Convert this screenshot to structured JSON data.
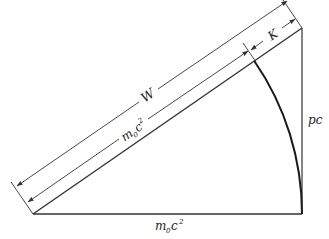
{
  "diagram": {
    "colors": {
      "line": "#333333",
      "arc": "#1a1a1a",
      "text": "#222222",
      "background": "#ffffff"
    },
    "labels": {
      "total_energy": "W",
      "kinetic_energy": "K",
      "rest_energy_hyp": "m",
      "rest_energy_hyp_sub": "0",
      "rest_energy_hyp_c": "c",
      "rest_energy_hyp_sup": "2",
      "rest_energy_base": "m",
      "rest_energy_base_sub": "0",
      "rest_energy_base_c": "c",
      "rest_energy_base_sup": "2",
      "momentum": "pc"
    },
    "elements": [
      {
        "id": "base",
        "meaning": "rest energy m0c^2 (horizontal leg)"
      },
      {
        "id": "vertical-leg",
        "meaning": "pc"
      },
      {
        "id": "hypotenuse",
        "meaning": "W (total energy)"
      },
      {
        "id": "arc",
        "meaning": "radius m0c^2 swung from base to hypotenuse"
      },
      {
        "id": "dimension-W",
        "meaning": "W along hypotenuse"
      },
      {
        "id": "dimension-m0c2",
        "meaning": "m0c^2 portion of hypotenuse"
      },
      {
        "id": "dimension-K",
        "meaning": "K = W - m0c^2"
      }
    ]
  }
}
